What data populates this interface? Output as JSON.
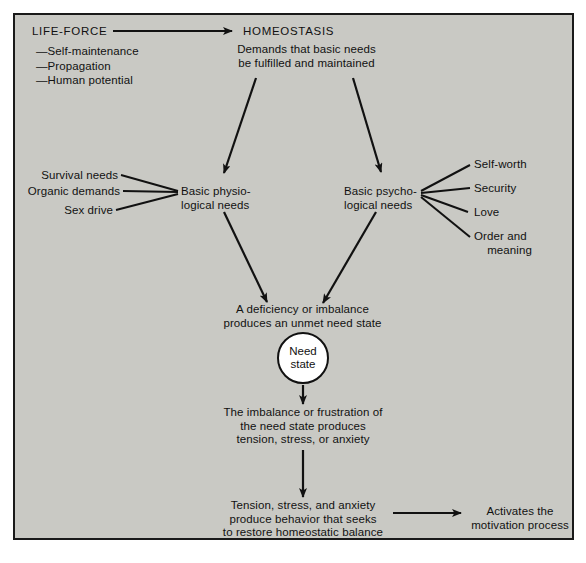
{
  "diagram": {
    "title_left": "LIFE-FORCE",
    "title_right": "HOMEOSTASIS",
    "life_force_items": "—Self-maintenance\n—Propagation\n—Human potential",
    "demands": "Demands that basic needs\nbe fulfilled and maintained",
    "physiological_node": "Basic physio-\nlogical needs",
    "psychological_node": "Basic psycho-\nlogical needs",
    "physiological_inputs": [
      "Survival needs",
      "Organic demands",
      "Sex drive"
    ],
    "psychological_outputs": [
      "Self-worth",
      "Security",
      "Love",
      "Order and\n    meaning"
    ],
    "deficiency": "A deficiency or imbalance\nproduces an unmet need state",
    "need_state_circle": "Need\nstate",
    "imbalance": "The imbalance or frustration of\nthe need state produces\ntension, stress, or anxiety",
    "behavior": "Tension, stress, and anxiety\nproduce behavior that seeks\nto restore homeostatic balance",
    "activates": "Activates the\nmotivation process"
  },
  "colors": {
    "panel_background": "#c9c9c4",
    "panel_border": "#1a1a1a",
    "ink": "#111111",
    "circle_fill": "#ffffff",
    "page_background": "#ffffff"
  }
}
